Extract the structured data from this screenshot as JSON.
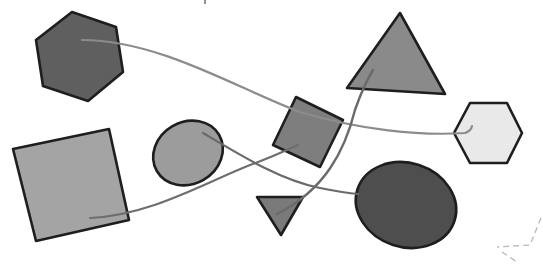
{
  "diagram": {
    "width": 543,
    "height": 264,
    "background": "#ffffff",
    "stroke_color": "#1e1e1e",
    "nodes": [
      {
        "id": "hexagon-top-left",
        "shape": "hexagon",
        "fill": "#5f5f5f",
        "points": "72,12 116,27 123,72 88,101 43,86 36,40"
      },
      {
        "id": "triangle-top-right",
        "shape": "triangle",
        "fill": "#8a8a8a",
        "points": "400,13 445,94 347,88"
      },
      {
        "id": "square-center",
        "shape": "square",
        "fill": "#7e7e7e",
        "points": "296,97 343,120 320,167 273,145"
      },
      {
        "id": "hexagon-right",
        "shape": "hexagon",
        "fill": "#e9e9e9",
        "points": "470,103 507,103 522,133 507,163 470,163 454,133"
      },
      {
        "id": "square-bottom-left",
        "shape": "square",
        "fill": "#a4a4a4",
        "points": "13,149 109,129 129,220 36,241"
      },
      {
        "id": "ellipse-center-left",
        "shape": "ellipse",
        "fill": "#9c9c9c",
        "cx": 188,
        "cy": 153,
        "rx": 36,
        "ry": 31,
        "rotate": -30
      },
      {
        "id": "triangle-bottom-small",
        "shape": "triangle",
        "fill": "#7a7a7a",
        "points": "257,197 303,197 281,235"
      },
      {
        "id": "ellipse-bottom-right",
        "shape": "ellipse",
        "fill": "#4e4e4e",
        "cx": 406,
        "cy": 205,
        "rx": 51,
        "ry": 42,
        "rotate": 18
      }
    ],
    "edges": [
      {
        "id": "edge-hexagon-to-hexagon-right",
        "from": "hexagon-top-left",
        "to": "hexagon-right",
        "color": "#8c8c8c",
        "width": 2.2,
        "d": "M 82 40 C 160 40, 240 90, 300 112 C 360 130, 420 136, 465 133 Q 471 131, 472 126"
      },
      {
        "id": "edge-square-to-square-center",
        "from": "square-bottom-left",
        "to": "square-center",
        "color": "#6e6e6e",
        "width": 2.2,
        "d": "M 90 218 C 150 215, 200 185, 250 165 C 270 158, 285 151, 298 145"
      },
      {
        "id": "edge-ellipse-to-ellipse",
        "from": "ellipse-center-left",
        "to": "ellipse-bottom-right",
        "color": "#6a6a6a",
        "width": 2.2,
        "d": "M 203 133 C 240 155, 280 180, 320 188 C 335 191, 345 193, 358 194"
      },
      {
        "id": "edge-triangle-to-triangle",
        "from": "triangle-bottom-small",
        "to": "triangle-top-right",
        "color": "#6a6a6a",
        "width": 2.4,
        "d": "M 277 214 C 325 190, 345 150, 355 110 C 362 90, 368 78, 373 70"
      }
    ],
    "decorations": [
      {
        "id": "dashed-corner",
        "stroke": "#b8b8b8",
        "d": "M 541 218 L 530 245 L 497 247"
      },
      {
        "id": "dashed-tail",
        "stroke": "#b8b8b8",
        "d": "M 502 252 L 517 262"
      },
      {
        "id": "top-mark",
        "stroke": "#555555",
        "d": "M 205 0 L 205 4"
      }
    ]
  }
}
